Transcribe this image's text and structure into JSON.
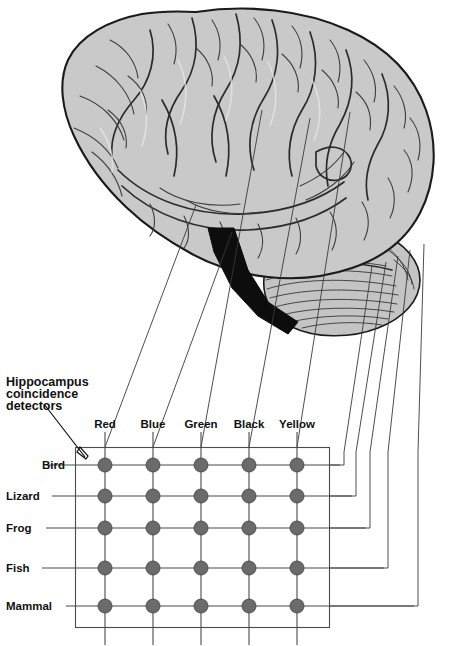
{
  "figure": {
    "background_color": "#ffffff"
  },
  "annotation": {
    "caption_line_1": "Hippocampus",
    "caption_line_2": "coincidence",
    "caption_line_3": "detectors",
    "arrow_target": "grid-top-left-corner"
  },
  "matrix": {
    "column_headers": [
      "Red",
      "Blue",
      "Green",
      "Black",
      "Yellow"
    ],
    "row_headers": [
      "Bird",
      "Lizard",
      "Frog",
      "Fish",
      "Mammal"
    ],
    "node_count": 25,
    "node_color": "#6b6b6b",
    "line_color": "#4a4a4a",
    "cells": [
      {
        "row": "Bird",
        "values": [
          "filled",
          "filled",
          "filled",
          "filled",
          "filled"
        ]
      },
      {
        "row": "Lizard",
        "values": [
          "filled",
          "filled",
          "filled",
          "filled",
          "filled"
        ]
      },
      {
        "row": "Frog",
        "values": [
          "filled",
          "filled",
          "filled",
          "filled",
          "filled"
        ]
      },
      {
        "row": "Fish",
        "values": [
          "filled",
          "filled",
          "filled",
          "filled",
          "filled"
        ]
      },
      {
        "row": "Mammal",
        "values": [
          "filled",
          "filled",
          "filled",
          "filled",
          "filled"
        ]
      }
    ]
  },
  "anatomy": {
    "cerebrum_label": "cerebral-cortex",
    "cerebellum_label": "cerebellum",
    "hippocampus_label": "hippocampus",
    "cerebrum_color": "#c9c9c9",
    "cerebellum_color": "#c4c4c4",
    "hippocampus_color": "#0d0d0d"
  },
  "connections": {
    "column_lead_count": 5,
    "row_lead_count": 5,
    "description": "Five column leads run up-right from the colour labels into the cortex; five row leads exit right of the matrix and route up into the cortex and cerebellum."
  }
}
